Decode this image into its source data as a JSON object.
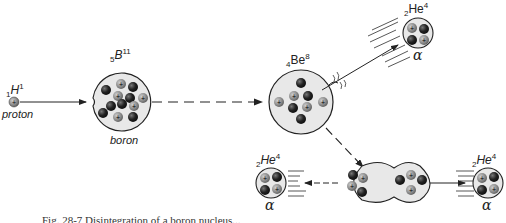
{
  "diagram": {
    "proton": {
      "symbol": "H",
      "atomic_number": "1",
      "mass_number": "1",
      "name": "proton"
    },
    "boron": {
      "symbol": "B",
      "atomic_number": "5",
      "mass_number": "11",
      "name": "boron"
    },
    "beryllium": {
      "symbol": "Be",
      "atomic_number": "4",
      "mass_number": "8"
    },
    "helium_top": {
      "symbol": "He",
      "atomic_number": "2",
      "mass_number": "4",
      "particle": "α"
    },
    "helium_left": {
      "symbol": "He",
      "atomic_number": "2",
      "mass_number": "4",
      "particle": "α"
    },
    "helium_right": {
      "symbol": "He",
      "atomic_number": "2",
      "mass_number": "4",
      "particle": "α"
    },
    "caption": "Fig. 28-7  Disintegration of a boron nucleus..."
  },
  "colors": {
    "neutron": "#1a1a1a",
    "proton": "#8a8a8a",
    "nucleus_fill": "#e6e6e6",
    "outline": "#222222"
  }
}
